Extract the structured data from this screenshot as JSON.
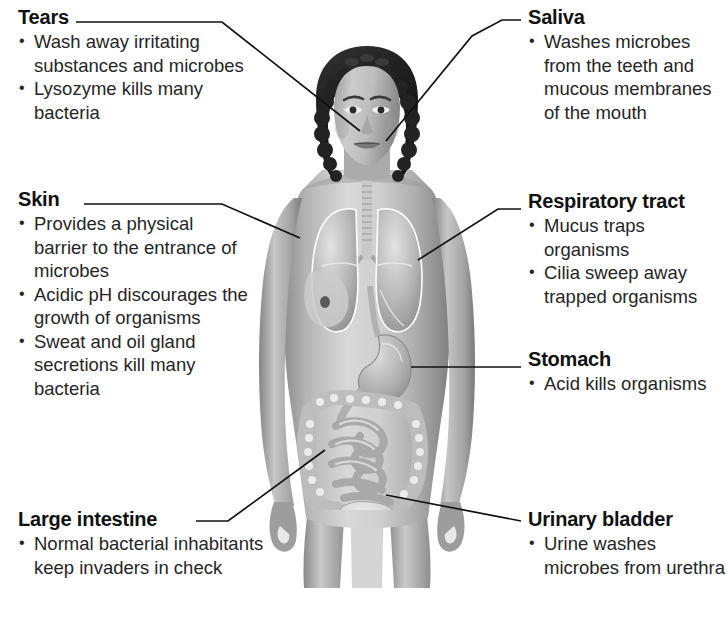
{
  "diagram": {
    "figure_alt": "Anatomical illustration of a human female body showing internal organs",
    "line_color": "#111111",
    "text_color": "#262626",
    "background": "#ffffff"
  },
  "labels": {
    "tears": {
      "title": "Tears",
      "bullets": [
        "Wash away irritating substances and microbes",
        "Lysozyme kills many bacteria"
      ]
    },
    "skin": {
      "title": "Skin",
      "bullets": [
        "Provides a physical barrier to the entrance of microbes",
        "Acidic pH discourages the growth of organisms",
        "Sweat and oil gland secretions kill many bacteria"
      ]
    },
    "large_intestine": {
      "title": "Large intestine",
      "bullets": [
        "Normal bacterial inhabitants keep invaders in check"
      ]
    },
    "saliva": {
      "title": "Saliva",
      "bullets": [
        "Washes microbes from the teeth and mucous membranes of the mouth"
      ]
    },
    "respiratory_tract": {
      "title": "Respiratory tract",
      "bullets": [
        "Mucus traps organisms",
        "Cilia sweep away trapped organisms"
      ]
    },
    "stomach": {
      "title": "Stomach",
      "bullets": [
        "Acid kills organisms"
      ]
    },
    "urinary_bladder": {
      "title": "Urinary bladder",
      "bullets": [
        "Urine washes microbes from urethra"
      ]
    }
  },
  "anatomy_parts": [
    "head",
    "hair",
    "eyes",
    "mouth",
    "trachea",
    "lungs",
    "stomach",
    "small-intestine",
    "large-intestine",
    "urinary-bladder",
    "arms",
    "torso",
    "legs"
  ]
}
